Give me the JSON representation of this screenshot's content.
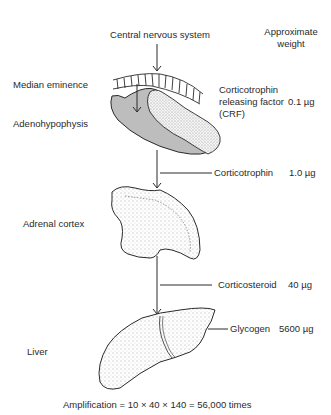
{
  "diagram": {
    "header": {
      "source": "Central nervous system",
      "weight_heading_line1": "Approximate",
      "weight_heading_line2": "weight"
    },
    "organs": [
      {
        "label": "Median eminence"
      },
      {
        "label": "Adenohypophysis"
      },
      {
        "label": "Adrenal cortex"
      },
      {
        "label": "Liver"
      }
    ],
    "products": [
      {
        "line1": "Corticotrophin",
        "line2": "releasing factor",
        "line3": "(CRF)",
        "weight": "0.1 µg"
      },
      {
        "line1": "Corticotrophin",
        "weight": "1.0 µg"
      },
      {
        "line1": "Corticosteroid",
        "weight": "40 µg"
      },
      {
        "line1": "Glycogen",
        "weight": "5600 µg"
      }
    ],
    "footer": {
      "amplification": "Amplification = 10 × 40 × 140 = 56,000 times"
    },
    "colors": {
      "ink": "#2a2a2a",
      "shaded_fill": "#bdbdbd",
      "stipple_fill": "#f2f2f2"
    }
  }
}
